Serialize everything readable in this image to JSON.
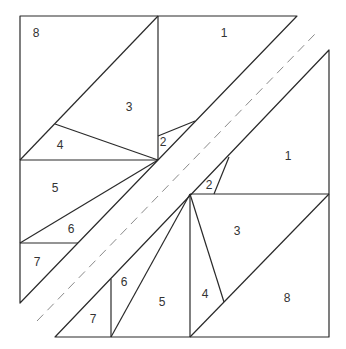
{
  "diagram": {
    "type": "quilt-block-piecing-diagram",
    "colors": {
      "line": "#2a2a2a",
      "seam_dashed": "#8a8a8a",
      "background": "#ffffff"
    },
    "upper_left_unit": {
      "labels": [
        {
          "text": "8",
          "x": 36,
          "y": 34
        },
        {
          "text": "1",
          "x": 224,
          "y": 34
        },
        {
          "text": "3",
          "x": 129,
          "y": 108
        },
        {
          "text": "4",
          "x": 60,
          "y": 146
        },
        {
          "text": "2",
          "x": 163,
          "y": 143
        },
        {
          "text": "5",
          "x": 55,
          "y": 189
        },
        {
          "text": "6",
          "x": 71,
          "y": 230
        },
        {
          "text": "7",
          "x": 37,
          "y": 263
        }
      ]
    },
    "lower_right_unit": {
      "labels": [
        {
          "text": "1",
          "x": 288,
          "y": 157
        },
        {
          "text": "2",
          "x": 209,
          "y": 186
        },
        {
          "text": "3",
          "x": 237,
          "y": 232
        },
        {
          "text": "6",
          "x": 124,
          "y": 283
        },
        {
          "text": "5",
          "x": 162,
          "y": 303
        },
        {
          "text": "4",
          "x": 205,
          "y": 295
        },
        {
          "text": "8",
          "x": 287,
          "y": 299
        },
        {
          "text": "7",
          "x": 93,
          "y": 320
        }
      ]
    }
  }
}
